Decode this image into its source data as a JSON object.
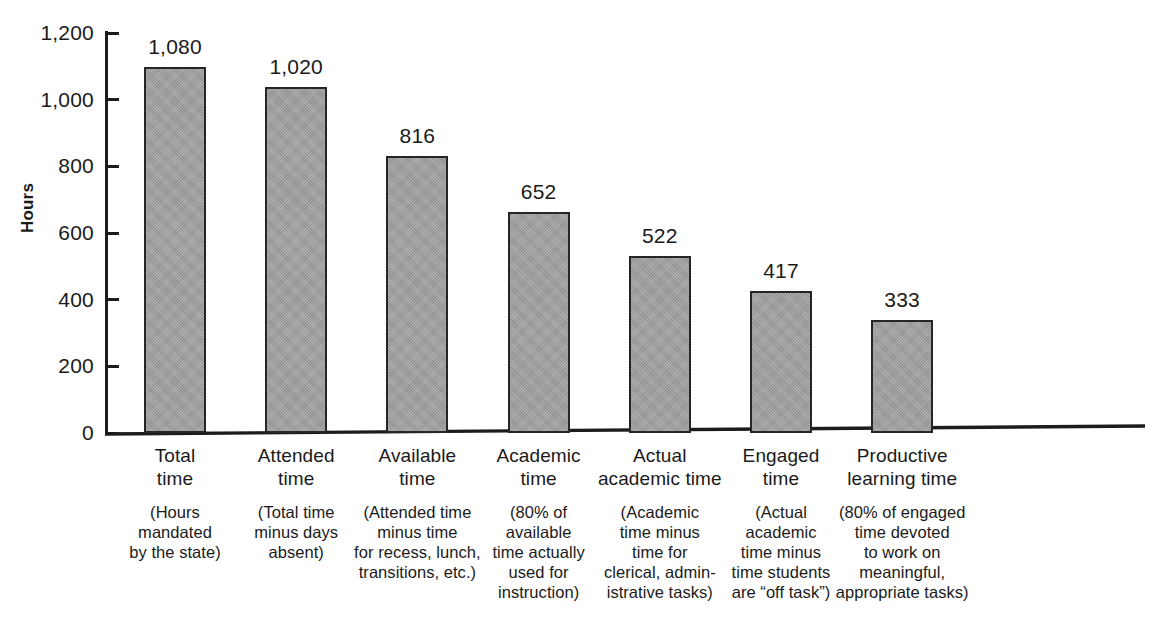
{
  "chart_data": {
    "type": "bar",
    "title": "",
    "xlabel": "",
    "ylabel": "Hours",
    "ylim": [
      0,
      1200
    ],
    "grid": false,
    "legend": "none",
    "y_ticks": [
      "0",
      "200",
      "400",
      "600",
      "800",
      "1,000",
      "1,200"
    ],
    "y_tick_values": [
      0,
      200,
      400,
      600,
      800,
      1000,
      1200
    ],
    "categories": [
      "Total time",
      "Attended time",
      "Available time",
      "Academic time",
      "Actual academic time",
      "Engaged time",
      "Productive learning time"
    ],
    "values": [
      1080,
      1020,
      816,
      652,
      522,
      417,
      333
    ],
    "value_labels": [
      "1,080",
      "1,020",
      "816",
      "652",
      "522",
      "417",
      "333"
    ],
    "bar_color": "#9c9c9c",
    "bar_border_color": "#262626",
    "axis_color": "#1c1c1c"
  },
  "bars": [
    {
      "title": "Total\ntime",
      "desc": "(Hours\nmandated\nby the state)",
      "value_label": "1,080"
    },
    {
      "title": "Attended\ntime",
      "desc": "(Total time\nminus days\nabsent)",
      "value_label": "1,020"
    },
    {
      "title": "Available\ntime",
      "desc": "(Attended time\nminus time\nfor recess, lunch,\ntransitions, etc.)",
      "value_label": "816"
    },
    {
      "title": "Academic\ntime",
      "desc": "(80% of\navailable\ntime actually\nused for\ninstruction)",
      "value_label": "652"
    },
    {
      "title": "Actual\nacademic time",
      "desc": "(Academic\ntime minus\ntime for\nclerical, admin-\nistrative tasks)",
      "value_label": "522"
    },
    {
      "title": "Engaged\ntime",
      "desc": "(Actual\nacademic\ntime minus\ntime students\nare “off task”)",
      "value_label": "417"
    },
    {
      "title": "Productive\nlearning time",
      "desc": "(80% of engaged\ntime devoted\nto work on\nmeaningful,\nappropriate tasks)",
      "value_label": "333"
    }
  ],
  "axis": {
    "y_title": "Hours"
  }
}
